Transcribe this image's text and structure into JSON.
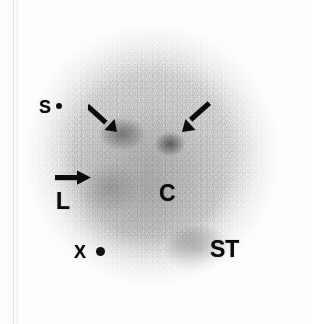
{
  "figure": {
    "kind": "scintigraphy-scan",
    "modality_note": "planar nuclear medicine gamma-camera image",
    "background_color": "#fdfdfd",
    "field_color": "#9a9a9a",
    "annotation_color": "#0b0b0b"
  },
  "labels": [
    {
      "id": "s",
      "text": "S",
      "meaning": "spleen-marker",
      "x": 39,
      "y": 98
    },
    {
      "id": "l",
      "text": "L",
      "meaning": "liver",
      "x": 56,
      "y": 190
    },
    {
      "id": "c",
      "text": "C",
      "meaning": "cardiac-blood-pool",
      "x": 159,
      "y": 182
    },
    {
      "id": "x",
      "text": "X",
      "meaning": "reference-marker",
      "x": 74,
      "y": 243
    },
    {
      "id": "st",
      "text": "ST",
      "meaning": "stomach",
      "x": 210,
      "y": 238
    }
  ],
  "markers": [
    {
      "id": "marker-s",
      "shape": "dot",
      "x": 56,
      "y": 103,
      "size": 6
    },
    {
      "id": "marker-x",
      "shape": "dot",
      "x": 96,
      "y": 247,
      "size": 9
    }
  ],
  "arrows": [
    {
      "id": "arrow-left-upper",
      "direction": "down-right",
      "x": 88,
      "y": 101,
      "points_to": "left-focal-uptake"
    },
    {
      "id": "arrow-right-upper",
      "direction": "down-left",
      "x": 178,
      "y": 101,
      "points_to": "right-focal-uptake"
    },
    {
      "id": "arrow-left-mid",
      "direction": "right",
      "x": 55,
      "y": 168,
      "points_to": "hepatic-uptake"
    }
  ],
  "foci": [
    {
      "id": "focus-left",
      "x": 122,
      "y": 134,
      "intensity": "high"
    },
    {
      "id": "focus-right",
      "x": 170,
      "y": 144,
      "intensity": "high"
    },
    {
      "id": "focus-stomach",
      "x": 200,
      "y": 250,
      "intensity": "high"
    }
  ]
}
